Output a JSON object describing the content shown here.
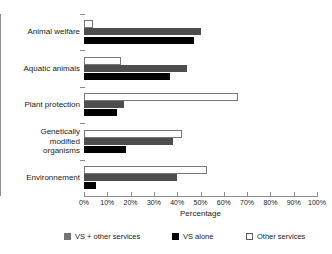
{
  "chart_data": {
    "type": "bar",
    "orientation": "horizontal",
    "title": "",
    "xlabel": "Percentage",
    "ylabel": "",
    "xlim": [
      0,
      100
    ],
    "xticks": [
      "0%",
      "10%",
      "20%",
      "30%",
      "40%",
      "50%",
      "60%",
      "70%",
      "80%",
      "90%",
      "100%"
    ],
    "grid": false,
    "legend_position": "bottom",
    "categories": [
      "Animal welfare",
      "Aquatic animals",
      "Plant protection",
      "Genetically\nmodified\norganisms",
      "Environnement"
    ],
    "series": [
      {
        "name": "VS + other services",
        "color": "#4d4d4d",
        "values": [
          50,
          44,
          17,
          38,
          40
        ]
      },
      {
        "name": "VS alone",
        "color": "#000000",
        "values": [
          47,
          37,
          14,
          18,
          5
        ]
      },
      {
        "name": "Other services",
        "color": "#ffffff",
        "values": [
          4,
          16,
          66,
          42,
          53
        ]
      }
    ]
  },
  "axis": {
    "x_title": "Percentage",
    "ticks": [
      {
        "label": "0%",
        "value": 0
      },
      {
        "label": "10%",
        "value": 10
      },
      {
        "label": "20%",
        "value": 20
      },
      {
        "label": "30%",
        "value": 30
      },
      {
        "label": "40%",
        "value": 40
      },
      {
        "label": "50%",
        "value": 50
      },
      {
        "label": "60%",
        "value": 60
      },
      {
        "label": "70%",
        "value": 70
      },
      {
        "label": "80%",
        "value": 80
      },
      {
        "label": "90%",
        "value": 90
      },
      {
        "label": "100%",
        "value": 100
      }
    ]
  },
  "categories": [
    {
      "label": "Animal welfare"
    },
    {
      "label": "Aquatic animals"
    },
    {
      "label": "Plant protection"
    },
    {
      "label": "Genetically\nmodified\norganisms"
    },
    {
      "label": "Environnement"
    }
  ],
  "legend": {
    "items": [
      {
        "label": "VS + other services",
        "color": "#4d4d4d"
      },
      {
        "label": "VS alone",
        "color": "#000000"
      },
      {
        "label": "Other services",
        "color": "#ffffff"
      }
    ]
  }
}
